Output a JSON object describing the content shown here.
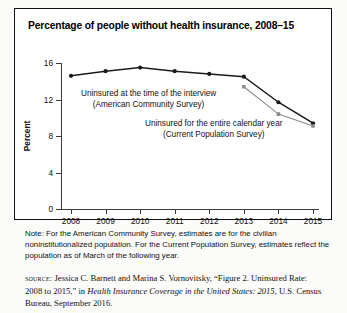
{
  "figure": {
    "title": "Percentage of people without health insurance, 2008–15",
    "note": "Note: For the American Community Survey, estimates are for the civilian noninstitutionalized population. For the Current Population Survey, estimates reflect the population as of March of the following year.",
    "source": {
      "label": "source:",
      "text_before_italic": " Jessica C. Barnett and Marina S. Vornovitsky, “Figure 2. Uninsured Rate: 2008 to 2015,” in ",
      "italic_title": "Health Insurance Coverage in the United States: 2015",
      "text_after_italic": ", U.S. Census Bureau, September 2016."
    },
    "annotations": [
      {
        "line1": "Uninsured at the time of the interview",
        "line2": "(American Community Survey)"
      },
      {
        "line1": "Uninsured for the entire calendar year",
        "line2": "(Current Population Survey)"
      }
    ]
  },
  "chart_data": {
    "type": "line",
    "title": "Percentage of people without health insurance, 2008–15",
    "xlabel": "",
    "ylabel": "Percent",
    "categories": [
      "2008",
      "2009",
      "2010",
      "2011",
      "2012",
      "2013",
      "2014",
      "2015"
    ],
    "ylim": [
      0,
      16
    ],
    "yticks": [
      0,
      4,
      8,
      12,
      16
    ],
    "grid": false,
    "legend": "in-plot annotations",
    "series": [
      {
        "name": "Uninsured at the time of the interview (American Community Survey)",
        "color": "#1a1a1a",
        "values": [
          14.6,
          15.1,
          15.5,
          15.1,
          14.8,
          14.5,
          11.7,
          9.4
        ]
      },
      {
        "name": "Uninsured for the entire calendar year (Current Population Survey)",
        "color": "#8c8c8c",
        "values": [
          null,
          null,
          null,
          null,
          null,
          13.4,
          10.4,
          9.1
        ]
      }
    ]
  }
}
